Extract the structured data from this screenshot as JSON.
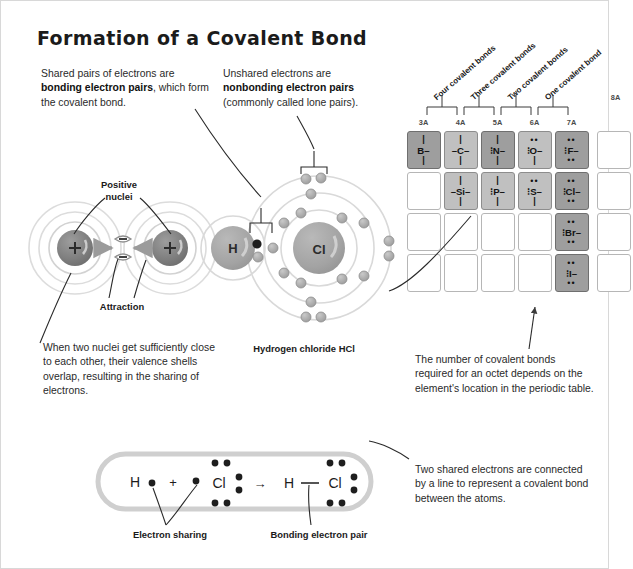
{
  "title": "Formation of a Covalent Bond",
  "callouts": {
    "bonding": {
      "line1": "Shared pairs of electrons are",
      "bold": "bonding electron pairs",
      "after_bold": ", which",
      "line3": "form the covalent bond."
    },
    "nonbonding": {
      "line1": "Unshared electrons are",
      "bold": "nonbonding electron pairs",
      "line3": "(commonly called lone pairs)."
    },
    "overlap": "When two nuclei get sufficiently close to each other, their valence shells overlap, resulting in the sharing of electrons.",
    "octet": "The number of covalent bonds required for an octet depends on the element's location in the periodic table.",
    "two_shared": "Two shared electrons are connected by a line to represent a covalent bond between the atoms."
  },
  "labels": {
    "positive_nuclei": "Positive\nnuclei",
    "positive_nuclei_l1": "Positive",
    "positive_nuclei_l2": "nuclei",
    "attraction": "Attraction",
    "hcl_caption": "Hydrogen chloride HCl",
    "electron_sharing": "Electron sharing",
    "bonding_electron_pair": "Bonding electron pair"
  },
  "atom_diagrams": {
    "left_pair": {
      "nucleus_charge": "+",
      "repulsion_signs": [
        "−",
        "−"
      ],
      "shell_count": 3
    },
    "hcl": {
      "hydrogen_symbol": "H",
      "chlorine_symbol": "Cl",
      "shared_electron_count": 2
    }
  },
  "lewis_equation": {
    "reactant_h": "H",
    "plus": "+",
    "reactant_cl": "Cl",
    "arrow": "→",
    "product_h": "H",
    "bond_dash": "—",
    "product_cl": "Cl"
  },
  "periodic_table": {
    "group_labels": [
      "3A",
      "4A",
      "5A",
      "6A",
      "7A"
    ],
    "group_label_8a": "8A",
    "bond_count_labels": [
      "Four covalent bonds",
      "Three covalent bonds",
      "Two covalent bonds",
      "One covalent bond"
    ],
    "colors": {
      "shaded_dark": "#9e9e9e",
      "shaded_mid": "#c0c0c0",
      "empty": "#ffffff",
      "border": "#b6b6b6"
    },
    "rows": [
      [
        {
          "symbol": "B",
          "shade": "dark",
          "top": "bar",
          "bottom": "bar",
          "left": "",
          "right": "dash"
        },
        {
          "symbol": "C",
          "shade": "mid",
          "top": "bar",
          "bottom": "bar",
          "left": "dash",
          "right": "dash"
        },
        {
          "symbol": "N",
          "shade": "dark",
          "top": "bar",
          "bottom": "bar",
          "left": "dots",
          "right": "dash"
        },
        {
          "symbol": "O",
          "shade": "mid",
          "top": "dots",
          "bottom": "bar",
          "left": "dots",
          "right": "dash"
        },
        {
          "symbol": "F",
          "shade": "dark",
          "top": "dots",
          "bottom": "dots",
          "left": "dots",
          "right": "dash"
        },
        {
          "symbol": "",
          "shade": "empty",
          "top": "",
          "bottom": "",
          "left": "",
          "right": ""
        }
      ],
      [
        {
          "symbol": "",
          "shade": "empty",
          "top": "",
          "bottom": "",
          "left": "",
          "right": ""
        },
        {
          "symbol": "Si",
          "shade": "mid",
          "top": "bar",
          "bottom": "bar",
          "left": "dash",
          "right": "dash"
        },
        {
          "symbol": "P",
          "shade": "mid",
          "top": "bar",
          "bottom": "bar",
          "left": "dots",
          "right": "dash"
        },
        {
          "symbol": "S",
          "shade": "mid",
          "top": "dots",
          "bottom": "bar",
          "left": "dots",
          "right": "dash"
        },
        {
          "symbol": "Cl",
          "shade": "dark",
          "top": "dots",
          "bottom": "dots",
          "left": "dots",
          "right": "dash"
        },
        {
          "symbol": "",
          "shade": "empty",
          "top": "",
          "bottom": "",
          "left": "",
          "right": ""
        }
      ],
      [
        {
          "symbol": "",
          "shade": "empty",
          "top": "",
          "bottom": "",
          "left": "",
          "right": ""
        },
        {
          "symbol": "",
          "shade": "empty",
          "top": "",
          "bottom": "",
          "left": "",
          "right": ""
        },
        {
          "symbol": "",
          "shade": "empty",
          "top": "",
          "bottom": "",
          "left": "",
          "right": ""
        },
        {
          "symbol": "",
          "shade": "empty",
          "top": "",
          "bottom": "",
          "left": "",
          "right": ""
        },
        {
          "symbol": "Br",
          "shade": "dark",
          "top": "dots",
          "bottom": "dots",
          "left": "dots",
          "right": "dash"
        },
        {
          "symbol": "",
          "shade": "empty",
          "top": "",
          "bottom": "",
          "left": "",
          "right": ""
        }
      ],
      [
        {
          "symbol": "",
          "shade": "empty",
          "top": "",
          "bottom": "",
          "left": "",
          "right": ""
        },
        {
          "symbol": "",
          "shade": "empty",
          "top": "",
          "bottom": "",
          "left": "",
          "right": ""
        },
        {
          "symbol": "",
          "shade": "empty",
          "top": "",
          "bottom": "",
          "left": "",
          "right": ""
        },
        {
          "symbol": "",
          "shade": "empty",
          "top": "",
          "bottom": "",
          "left": "",
          "right": ""
        },
        {
          "symbol": "I",
          "shade": "dark",
          "top": "dots",
          "bottom": "dots",
          "left": "dots",
          "right": "dash"
        },
        {
          "symbol": "",
          "shade": "empty",
          "top": "",
          "bottom": "",
          "left": "",
          "right": ""
        }
      ]
    ]
  }
}
